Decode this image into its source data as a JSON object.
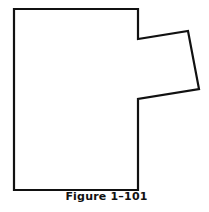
{
  "figure": {
    "caption": "Figure 1–101",
    "shape": {
      "description": "Rectangle with a tilted quadrilateral tab protruding from the right side",
      "stroke_color": "#111111",
      "fill_color": "#ffffff",
      "points": "14,9 138,9 138,39 188,31 199,89 138,99 138,190 14,190"
    }
  }
}
